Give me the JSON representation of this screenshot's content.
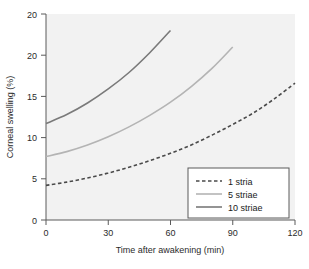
{
  "chart_data": {
    "type": "line",
    "title": "",
    "xlabel": "Time after awakening (min)",
    "ylabel": "Corneal swelling (%)",
    "xlim": [
      0,
      120
    ],
    "ylim": [
      0,
      25
    ],
    "grid": false,
    "background_color": "#f2f2f2",
    "legend_position": "bottom-right",
    "xticks": [
      "0",
      "30",
      "60",
      "90",
      "120"
    ],
    "xtick_values": [
      0,
      30,
      60,
      90,
      120
    ],
    "yticks": [
      "0",
      "5",
      "10",
      "15",
      "20",
      "20"
    ],
    "ytick_values": [
      0,
      5,
      10,
      15,
      20,
      25
    ],
    "series": [
      {
        "name": "1 stria",
        "style": "dashed",
        "color": "#4a4a4a",
        "x": [
          0,
          10,
          20,
          30,
          40,
          50,
          60,
          70,
          80,
          90,
          100,
          110,
          120
        ],
        "values": [
          4.2,
          4.6,
          5.1,
          5.7,
          6.4,
          7.2,
          8.1,
          9.1,
          10.3,
          11.6,
          13.0,
          14.7,
          16.6
        ]
      },
      {
        "name": "5 striae",
        "style": "solid",
        "color": "#b4b4b4",
        "x": [
          0,
          10,
          20,
          30,
          40,
          50,
          60,
          70,
          80,
          90
        ],
        "values": [
          7.7,
          8.3,
          9.1,
          10.1,
          11.3,
          12.7,
          14.3,
          16.2,
          18.4,
          21.0
        ]
      },
      {
        "name": "10 striae",
        "style": "solid",
        "color": "#7a7a7a",
        "x": [
          0,
          10,
          20,
          30,
          40,
          50,
          60
        ],
        "values": [
          11.7,
          12.8,
          14.2,
          15.9,
          17.9,
          20.3,
          23.0
        ]
      }
    ]
  },
  "legend": {
    "entries": [
      {
        "label": "1 stria"
      },
      {
        "label": "5 striae"
      },
      {
        "label": "10 striae"
      }
    ]
  }
}
